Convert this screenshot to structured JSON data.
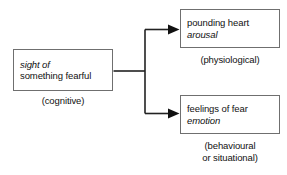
{
  "diagram": {
    "type": "flowchart",
    "background_color": "#ffffff",
    "line_color": "#222222",
    "box_border_color": "#6f6f6f",
    "text_color": "#111111",
    "nodes": {
      "stimulus": {
        "line1_italic": "sight of",
        "line2": "something fearful",
        "caption": "(cognitive)"
      },
      "arousal": {
        "line1": "pounding heart",
        "line2_italic": "arousal",
        "caption": "(physiological)"
      },
      "emotion": {
        "line1": "feelings of fear",
        "line2_italic": "emotion",
        "caption_line1": "(behavioural",
        "caption_line2": "or situational)"
      }
    },
    "connectors": [
      {
        "name": "stimulus-to-arousal",
        "arrowhead": "solid-triangle"
      },
      {
        "name": "stimulus-to-emotion",
        "arrowhead": "solid-triangle"
      }
    ]
  }
}
